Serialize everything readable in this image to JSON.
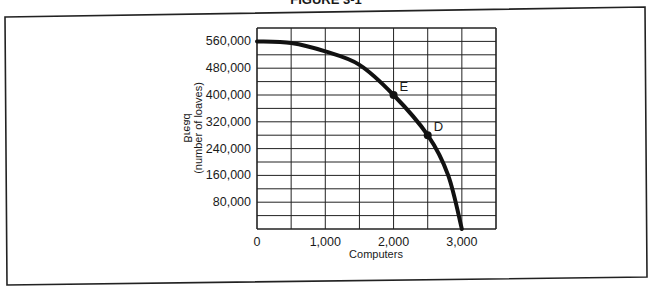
{
  "figure": {
    "title_partial": "FIGURE 3-1"
  },
  "chart_data": {
    "type": "line",
    "title": "",
    "xlabel": "Computers",
    "ylabel": "Bread",
    "ylabel_sub": "(number of loaves)",
    "xlim": [
      0,
      3500
    ],
    "ylim": [
      0,
      600000
    ],
    "grid": true,
    "x_ticks": [
      {
        "value": 0,
        "label": "0"
      },
      {
        "value": 1000,
        "label": "1,000"
      },
      {
        "value": 2000,
        "label": "2,000"
      },
      {
        "value": 3000,
        "label": "3,000"
      }
    ],
    "y_ticks": [
      {
        "value": 80000,
        "label": "80,000"
      },
      {
        "value": 160000,
        "label": "160,000"
      },
      {
        "value": 240000,
        "label": "240,000"
      },
      {
        "value": 320000,
        "label": "320,000"
      },
      {
        "value": 400000,
        "label": "400,000"
      },
      {
        "value": 480000,
        "label": "480,000"
      },
      {
        "value": 560000,
        "label": "560,000"
      }
    ],
    "series": [
      {
        "name": "Production possibilities frontier",
        "x": [
          0,
          500,
          1000,
          1500,
          2000,
          2500,
          2800,
          3000
        ],
        "y": [
          560000,
          555000,
          530000,
          490000,
          400000,
          280000,
          160000,
          0
        ]
      }
    ],
    "points": [
      {
        "label": "E",
        "x": 2000,
        "y": 400000
      },
      {
        "label": "D",
        "x": 2500,
        "y": 280000
      }
    ]
  }
}
